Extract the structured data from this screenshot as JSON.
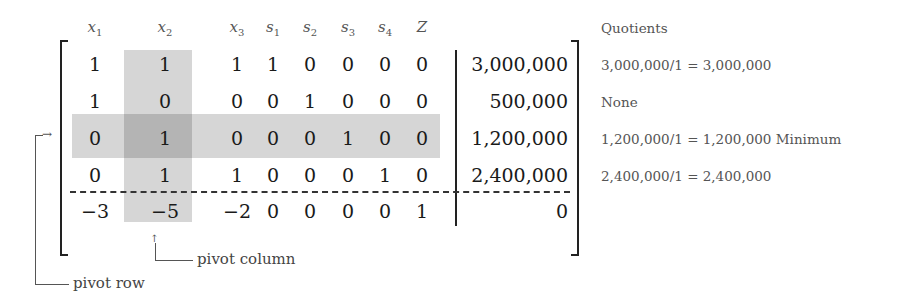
{
  "tableau": {
    "headers": [
      {
        "var": "x",
        "sub": "1"
      },
      {
        "var": "x",
        "sub": "2"
      },
      {
        "var": "x",
        "sub": "3"
      },
      {
        "var": "s",
        "sub": "1"
      },
      {
        "var": "s",
        "sub": "2"
      },
      {
        "var": "s",
        "sub": "3"
      },
      {
        "var": "s",
        "sub": "4"
      },
      {
        "var": "Z",
        "sub": ""
      }
    ],
    "rows": [
      {
        "coeffs": [
          "1",
          "1",
          "1",
          "1",
          "0",
          "0",
          "0",
          "0"
        ],
        "rhs": "3,000,000"
      },
      {
        "coeffs": [
          "1",
          "0",
          "0",
          "0",
          "1",
          "0",
          "0",
          "0"
        ],
        "rhs": "500,000"
      },
      {
        "coeffs": [
          "0",
          "1",
          "0",
          "0",
          "0",
          "1",
          "0",
          "0"
        ],
        "rhs": "1,200,000"
      },
      {
        "coeffs": [
          "0",
          "1",
          "1",
          "0",
          "0",
          "0",
          "1",
          "0"
        ],
        "rhs": "2,400,000"
      },
      {
        "coeffs": [
          "−3",
          "−5",
          "−2",
          "0",
          "0",
          "0",
          "0",
          "1"
        ],
        "rhs": "0"
      }
    ],
    "pivot_column_index": 1,
    "pivot_row_index": 2
  },
  "quotients": {
    "title": "Quotients",
    "items": [
      "3,000,000/1 = 3,000,000",
      "None",
      "1,200,000/1 = 1,200,000 Minimum",
      "2,400,000/1 = 2,400,000"
    ]
  },
  "annotations": {
    "pivot_column": "pivot column",
    "pivot_row": "pivot row"
  },
  "colors": {
    "highlight": "#d6d6d6",
    "highlight_intersection": "#b4b4b4"
  }
}
